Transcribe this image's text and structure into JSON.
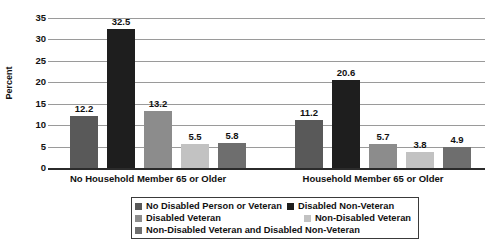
{
  "chart_data": {
    "type": "bar",
    "title": "",
    "xlabel": "",
    "ylabel": "Percent",
    "ylim": [
      0,
      35
    ],
    "ytick_step": 5,
    "grid": true,
    "legend_position": "bottom-center",
    "yticks": [
      "35",
      "30",
      "25",
      "20",
      "15",
      "10",
      "5",
      "0"
    ],
    "categories": [
      "No Household Member 65 or Older",
      "Household Member 65 or Older"
    ],
    "series": [
      {
        "name": "No Disabled Person or Veteran",
        "color": "#595959",
        "values": [
          12.2,
          11.2
        ],
        "labels": [
          "12.2",
          "11.2"
        ]
      },
      {
        "name": "Disabled Non-Veteran",
        "color": "#1e1e1e",
        "values": [
          32.5,
          20.6
        ],
        "labels": [
          "32.5",
          "20.6"
        ]
      },
      {
        "name": "Disabled Veteran",
        "color": "#8c8c8c",
        "values": [
          13.2,
          5.7
        ],
        "labels": [
          "13.2",
          "5.7"
        ]
      },
      {
        "name": "Non-Disabled Veteran",
        "color": "#c2c2c2",
        "values": [
          5.5,
          3.8
        ],
        "labels": [
          "5.5",
          "3.8"
        ]
      },
      {
        "name": "Non-Disabled Veteran and Disabled Non-Veteran",
        "color": "#6e6e6e",
        "values": [
          5.8,
          4.9
        ],
        "labels": [
          "5.8",
          "4.9"
        ]
      }
    ]
  },
  "legend": {
    "items": [
      {
        "label": "No Disabled Person or Veteran",
        "color": "#595959"
      },
      {
        "label": "Disabled Non-Veteran",
        "color": "#1e1e1e"
      },
      {
        "label": "Disabled Veteran",
        "color": "#8c8c8c"
      },
      {
        "label": "Non-Disabled Veteran",
        "color": "#c2c2c2"
      },
      {
        "label": "Non-Disabled Veteran and Disabled Non-Veteran",
        "color": "#6e6e6e"
      }
    ]
  }
}
